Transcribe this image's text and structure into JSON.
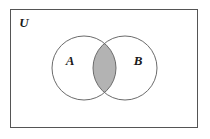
{
  "figure": {
    "type": "venn-diagram",
    "title": "",
    "universe_label": "U",
    "set_labels": [
      "A",
      "B"
    ],
    "shaded_region": "A intersect B",
    "colors": {
      "background": "#ffffff",
      "stroke": "#666666",
      "universe_stroke": "#555555",
      "shade_fill": "#b3b3b3",
      "label_color": "#1a1a1a",
      "page_border": "#b8b8b8"
    },
    "geometry": {
      "rect": {
        "x": 10,
        "y": 9,
        "width": 188,
        "height": 119
      },
      "circle_a": {
        "cx": 84,
        "cy": 68,
        "r": 32
      },
      "circle_b": {
        "cx": 125,
        "cy": 68,
        "r": 32
      },
      "label_u_pos": {
        "x": 24,
        "y": 27
      },
      "label_a_pos": {
        "x": 70,
        "y": 64
      },
      "label_b_pos": {
        "x": 137,
        "y": 64
      }
    }
  }
}
